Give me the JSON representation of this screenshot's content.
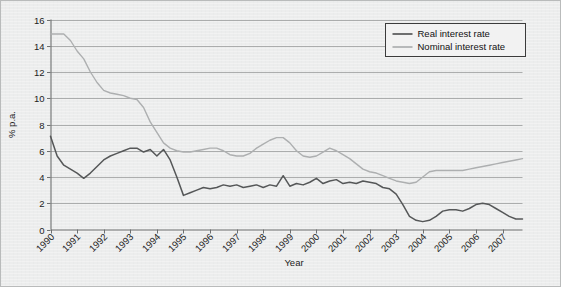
{
  "chart_data": {
    "type": "line",
    "title": "",
    "xlabel": "Year",
    "ylabel": "% p.a.",
    "xlim": [
      1990,
      2007.75
    ],
    "ylim": [
      0,
      16
    ],
    "ytick_step": 2,
    "yticks": [
      "0",
      "2",
      "4",
      "6",
      "8",
      "10",
      "12",
      "14",
      "16"
    ],
    "xticks": [
      "1990",
      "1991",
      "1992",
      "1993",
      "1994",
      "1995",
      "1996",
      "1997",
      "1998",
      "1999",
      "2000",
      "2001",
      "2002",
      "2003",
      "2004",
      "2005",
      "2006",
      "2007"
    ],
    "grid": "horizontal",
    "legend_position": "top-right",
    "legend": [
      "Real interest rate",
      "Nominal interest rate"
    ],
    "colors": {
      "real": "#555758",
      "nominal": "#adafb0",
      "axis": "#6e7070",
      "grid": "#9a9c9c",
      "background": "#eceded",
      "frame": "#b9bbbb"
    },
    "x": [
      1990.0,
      1990.25,
      1990.5,
      1990.75,
      1991.0,
      1991.25,
      1991.5,
      1991.75,
      1992.0,
      1992.25,
      1992.5,
      1992.75,
      1993.0,
      1993.25,
      1993.5,
      1993.75,
      1994.0,
      1994.25,
      1994.5,
      1994.75,
      1995.0,
      1995.25,
      1995.5,
      1995.75,
      1996.0,
      1996.25,
      1996.5,
      1996.75,
      1997.0,
      1997.25,
      1997.5,
      1997.75,
      1998.0,
      1998.25,
      1998.5,
      1998.75,
      1999.0,
      1999.25,
      1999.5,
      1999.75,
      2000.0,
      2000.25,
      2000.5,
      2000.75,
      2001.0,
      2001.25,
      2001.5,
      2001.75,
      2002.0,
      2002.25,
      2002.5,
      2002.75,
      2003.0,
      2003.25,
      2003.5,
      2003.75,
      2004.0,
      2004.25,
      2004.5,
      2004.75,
      2005.0,
      2005.25,
      2005.5,
      2005.75,
      2006.0,
      2006.25,
      2006.5,
      2006.75,
      2007.0,
      2007.25,
      2007.5,
      2007.75
    ],
    "series": [
      {
        "name": "Real interest rate",
        "color": "#555758",
        "values": [
          7.1,
          5.6,
          4.9,
          4.6,
          4.3,
          3.9,
          4.3,
          4.8,
          5.3,
          5.6,
          5.8,
          6.0,
          6.2,
          6.2,
          5.9,
          6.1,
          5.6,
          6.1,
          5.3,
          4.0,
          2.6,
          2.8,
          3.0,
          3.2,
          3.1,
          3.2,
          3.4,
          3.3,
          3.4,
          3.2,
          3.3,
          3.4,
          3.2,
          3.4,
          3.3,
          4.1,
          3.3,
          3.5,
          3.4,
          3.6,
          3.9,
          3.5,
          3.7,
          3.8,
          3.5,
          3.6,
          3.5,
          3.7,
          3.6,
          3.5,
          3.2,
          3.1,
          2.7,
          1.9,
          1.0,
          0.7,
          0.6,
          0.7,
          1.0,
          1.4,
          1.5,
          1.5,
          1.4,
          1.6,
          1.9,
          2.0,
          1.9,
          1.6,
          1.3,
          1.0,
          0.8,
          0.8
        ]
      },
      {
        "name": "Nominal interest rate",
        "color": "#adafb0",
        "values": [
          14.9,
          14.9,
          14.9,
          14.4,
          13.6,
          13.0,
          12.0,
          11.2,
          10.6,
          10.4,
          10.3,
          10.2,
          10.0,
          9.9,
          9.3,
          8.2,
          7.4,
          6.6,
          6.2,
          6.0,
          5.9,
          5.9,
          6.0,
          6.1,
          6.2,
          6.2,
          6.0,
          5.7,
          5.6,
          5.6,
          5.8,
          6.2,
          6.5,
          6.8,
          7.0,
          7.0,
          6.6,
          6.0,
          5.6,
          5.5,
          5.6,
          5.9,
          6.2,
          6.0,
          5.7,
          5.4,
          5.0,
          4.6,
          4.4,
          4.3,
          4.1,
          3.9,
          3.7,
          3.6,
          3.5,
          3.6,
          4.0,
          4.4,
          4.5,
          4.5,
          4.5,
          4.5,
          4.5,
          4.6,
          4.7,
          4.8,
          4.9,
          5.0,
          5.1,
          5.2,
          5.3,
          5.4
        ]
      }
    ]
  },
  "legend": {
    "items": [
      {
        "label": "Real interest rate"
      },
      {
        "label": "Nominal interest rate"
      }
    ]
  },
  "axes": {
    "y_title": "% p.a.",
    "x_title": "Year"
  }
}
